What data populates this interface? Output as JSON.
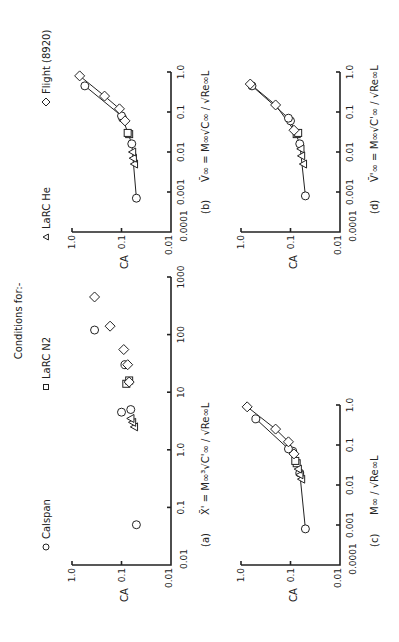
{
  "header": {
    "title": "Conditions for:-"
  },
  "legend": [
    {
      "symbol": "circle",
      "label": "Calspan"
    },
    {
      "symbol": "square",
      "label": "LaRC N2"
    },
    {
      "symbol": "triangle",
      "label": "LaRC He"
    },
    {
      "symbol": "diamond",
      "label": "Flight (8920)"
    }
  ],
  "panels": {
    "a": {
      "tag": "(a)",
      "xlabel": "X̄' = M∞³√C'∞ / √Re∞L",
      "ylabel": "CA"
    },
    "b": {
      "tag": "(b)",
      "xlabel": "V̄∞ = M∞√C∞ / √Re∞L",
      "ylabel": "CA"
    },
    "c": {
      "tag": "(c)",
      "xlabel": "M∞ / √Re∞L",
      "ylabel": "CA"
    },
    "d": {
      "tag": "(d)",
      "xlabel": "V̄'∞ = M∞√C'∞ / √Re∞L",
      "ylabel": "CA"
    }
  },
  "ticks": {
    "y": [
      "0.01",
      "0.1",
      "1.0"
    ],
    "x_a": [
      "0.01",
      "0.1",
      "1.0",
      "10",
      "100",
      "1000"
    ],
    "x_bcd": [
      "0.0001",
      "0.001",
      "0.01",
      "0.1",
      "1.0"
    ]
  },
  "chart_data": [
    {
      "type": "scatter",
      "title": "(a)",
      "xlabel": "X̄' = M∞³√C'∞/√Re∞L",
      "ylabel": "CA",
      "xscale": "log",
      "yscale": "log",
      "xlim": [
        0.01,
        1000
      ],
      "ylim": [
        0.01,
        1.0
      ],
      "series": [
        {
          "name": "Calspan",
          "marker": "circle",
          "x": [
            0.05,
            4.5,
            5,
            30,
            120
          ],
          "y": [
            0.05,
            0.1,
            0.065,
            0.085,
            0.35
          ]
        },
        {
          "name": "LaRC N2",
          "marker": "square",
          "x": [
            14,
            16
          ],
          "y": [
            0.08,
            0.07
          ]
        },
        {
          "name": "LaRC He",
          "marker": "triangle",
          "x": [
            2.5,
            3,
            3.5
          ],
          "y": [
            0.055,
            0.06,
            0.065
          ]
        },
        {
          "name": "Flight (8920)",
          "marker": "diamond",
          "x": [
            15,
            30,
            55,
            140,
            450
          ],
          "y": [
            0.07,
            0.075,
            0.09,
            0.17,
            0.35
          ]
        }
      ]
    },
    {
      "type": "line",
      "title": "(b)",
      "xlabel": "V̄∞ = M∞√C∞/√Re∞L",
      "ylabel": "CA",
      "xscale": "log",
      "yscale": "log",
      "xlim": [
        0.0001,
        1.0
      ],
      "ylim": [
        0.01,
        1.0
      ],
      "series": [
        {
          "name": "Calspan",
          "marker": "circle",
          "x": [
            0.0007,
            0.016,
            0.07,
            0.08,
            0.45
          ],
          "y": [
            0.05,
            0.062,
            0.095,
            0.1,
            0.55
          ]
        },
        {
          "name": "LaRC N2",
          "marker": "square",
          "x": [
            0.028,
            0.03
          ],
          "y": [
            0.07,
            0.075
          ]
        },
        {
          "name": "LaRC He",
          "marker": "triangle",
          "x": [
            0.005,
            0.007,
            0.01
          ],
          "y": [
            0.055,
            0.058,
            0.06
          ]
        },
        {
          "name": "Flight (8920)",
          "marker": "diamond",
          "x": [
            0.06,
            0.12,
            0.25,
            0.8
          ],
          "y": [
            0.085,
            0.11,
            0.22,
            0.7
          ]
        }
      ]
    },
    {
      "type": "line",
      "title": "(c)",
      "xlabel": "M∞/√Re∞L",
      "ylabel": "CA",
      "xscale": "log",
      "yscale": "log",
      "xlim": [
        0.0001,
        1.0
      ],
      "ylim": [
        0.01,
        1.0
      ],
      "series": [
        {
          "name": "Calspan",
          "marker": "circle",
          "x": [
            0.0008,
            0.02,
            0.07,
            0.08,
            0.45
          ],
          "y": [
            0.05,
            0.065,
            0.09,
            0.11,
            0.5
          ]
        },
        {
          "name": "LaRC N2",
          "marker": "square",
          "x": [
            0.035,
            0.04
          ],
          "y": [
            0.075,
            0.08
          ]
        },
        {
          "name": "LaRC He",
          "marker": "triangle",
          "x": [
            0.014,
            0.018,
            0.025
          ],
          "y": [
            0.06,
            0.065,
            0.07
          ]
        },
        {
          "name": "Flight (8920)",
          "marker": "diamond",
          "x": [
            0.06,
            0.12,
            0.25,
            0.9
          ],
          "y": [
            0.085,
            0.11,
            0.2,
            0.75
          ]
        }
      ]
    },
    {
      "type": "line",
      "title": "(d)",
      "xlabel": "V̄'∞ = M∞√C'∞/√Re∞L",
      "ylabel": "CA",
      "xscale": "log",
      "yscale": "log",
      "xlim": [
        0.0001,
        1.0
      ],
      "ylim": [
        0.01,
        1.0
      ],
      "series": [
        {
          "name": "Calspan",
          "marker": "circle",
          "x": [
            0.0008,
            0.016,
            0.06,
            0.07,
            0.45
          ],
          "y": [
            0.05,
            0.065,
            0.1,
            0.11,
            0.6
          ]
        },
        {
          "name": "LaRC N2",
          "marker": "square",
          "x": [
            0.028,
            0.03
          ],
          "y": [
            0.075,
            0.07
          ]
        },
        {
          "name": "LaRC He",
          "marker": "triangle",
          "x": [
            0.005,
            0.008,
            0.012
          ],
          "y": [
            0.055,
            0.06,
            0.062
          ]
        },
        {
          "name": "Flight (8920)",
          "marker": "diamond",
          "x": [
            0.035,
            0.15,
            0.5
          ],
          "y": [
            0.085,
            0.2,
            0.65
          ]
        }
      ]
    }
  ]
}
